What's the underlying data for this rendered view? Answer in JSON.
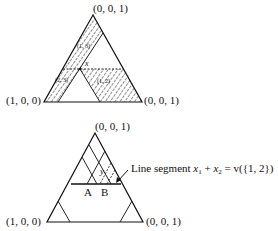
{
  "top_diagram": {
    "vertices": {
      "top": "(0, 0, 1)",
      "left": "(1, 0, 0)",
      "right": "(0, 0, 1)"
    },
    "point_label": "x",
    "region_labels": {
      "upper": "(1, 3)",
      "lower_left": "(2, 3)",
      "lower_right": "(1, 2)"
    }
  },
  "bottom_diagram": {
    "vertices": {
      "top": "(0, 0, 1)",
      "left": "(1, 0, 0)",
      "right": "(0, 0, 1)"
    },
    "point_label": "y",
    "segment_points": [
      "A",
      "B"
    ],
    "annotation": {
      "text_prefix": "Line segment ",
      "x1": "x",
      "sub1": "1",
      "plus": " + ",
      "x2": "x",
      "sub2": "2",
      "suffix": " = v({1, 2})"
    }
  }
}
